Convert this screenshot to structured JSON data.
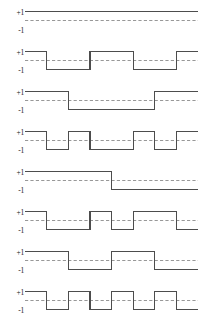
{
  "figure": {
    "name": "walsh-functions-order-8",
    "axis_labels": {
      "high": "+1",
      "low": "-1"
    },
    "colors": {
      "signal": "#4d4d4d",
      "zero_line": "#8c8c8c",
      "text": "#1a1a1a",
      "background": "#ffffff"
    },
    "levels": {
      "high": 1,
      "low": -1,
      "zero": 0
    }
  },
  "chart_data": {
    "type": "line",
    "title": "",
    "xlabel": "",
    "ylabel": "",
    "ylim": [
      -1,
      1
    ],
    "xlim": [
      0,
      8
    ],
    "grid": false,
    "legend": "none",
    "yticks": [
      1,
      -1
    ],
    "ytick_labels": [
      "+1",
      "-1"
    ],
    "zero_line": {
      "value": 0,
      "style": "dashed"
    },
    "segments_per_row": 8,
    "series": [
      {
        "name": "wal(0)",
        "row": 1,
        "values": [
          1,
          1,
          1,
          1,
          1,
          1,
          1,
          1
        ],
        "transitions": 0
      },
      {
        "name": "wal(7)",
        "row": 2,
        "values": [
          1,
          -1,
          -1,
          1,
          1,
          -1,
          -1,
          1
        ],
        "transitions": 4
      },
      {
        "name": "wal(1)",
        "row": 3,
        "values": [
          1,
          1,
          -1,
          -1,
          -1,
          -1,
          1,
          1
        ],
        "transitions": 2
      },
      {
        "name": "wal(6)",
        "row": 4,
        "values": [
          1,
          -1,
          1,
          -1,
          -1,
          1,
          -1,
          1
        ],
        "transitions": 6
      },
      {
        "name": "wal(3)",
        "row": 5,
        "values": [
          1,
          1,
          1,
          1,
          -1,
          -1,
          -1,
          -1
        ],
        "transitions": 1
      },
      {
        "name": "wal(4)",
        "row": 6,
        "values": [
          1,
          -1,
          -1,
          1,
          -1,
          1,
          1,
          -1
        ],
        "transitions": 6
      },
      {
        "name": "wal(2)",
        "row": 7,
        "values": [
          1,
          1,
          -1,
          -1,
          1,
          1,
          -1,
          -1
        ],
        "transitions": 3
      },
      {
        "name": "wal(5)",
        "row": 8,
        "values": [
          1,
          -1,
          1,
          -1,
          1,
          -1,
          1,
          -1
        ],
        "transitions": 7
      }
    ]
  }
}
